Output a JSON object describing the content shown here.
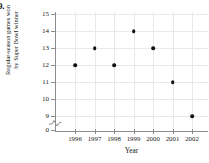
{
  "problem_label": "9.",
  "chart_data": {
    "type": "scatter",
    "title": "",
    "xlabel": "Year",
    "ylabel": "Regular-season games won by Super Bowl winner",
    "ylabel_lines": [
      "Regular-season games won",
      "by Super Bowl winner"
    ],
    "x": [
      1996,
      1997,
      1998,
      1999,
      2000,
      2001,
      2002
    ],
    "values": [
      12,
      13,
      12,
      14,
      13,
      11,
      9
    ],
    "categories": [
      "1996",
      "1997",
      "1998",
      "1999",
      "2000",
      "2001",
      "2002"
    ],
    "points": [
      {
        "x": 1996,
        "y": 12
      },
      {
        "x": 1997,
        "y": 13
      },
      {
        "x": 1998,
        "y": 12
      },
      {
        "x": 1999,
        "y": 14
      },
      {
        "x": 2000,
        "y": 13
      },
      {
        "x": 2001,
        "y": 11
      },
      {
        "x": 2002,
        "y": 9
      }
    ],
    "xlim": [
      1995.5,
      2002.8
    ],
    "ylim": [
      8.6,
      15
    ],
    "ytick_labels": [
      "15",
      "14",
      "13",
      "12",
      "11",
      "10",
      "9",
      "0"
    ],
    "ytick_values": [
      15,
      14,
      13,
      12,
      11,
      10,
      9,
      0
    ],
    "xtick_labels": [
      "1996",
      "1997",
      "1998",
      "1999",
      "2000",
      "2001",
      "2002"
    ],
    "axis_break": true,
    "axis_break_between": [
      0,
      9
    ],
    "grid": true,
    "legend": null,
    "colors": {
      "marker": "#111111",
      "grid": "#e9e9e9",
      "axis": "#8c8c8c",
      "text": "#1a1a1a",
      "background": "#ffffff"
    }
  }
}
